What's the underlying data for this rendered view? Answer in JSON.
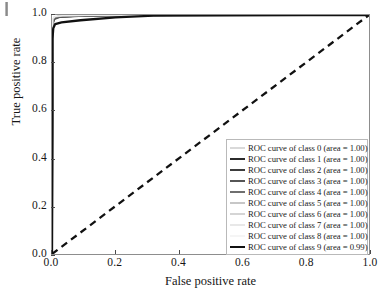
{
  "chart_data": {
    "type": "line",
    "title": "",
    "xlabel": "False positive rate",
    "ylabel": "True positive rate",
    "xlim": [
      0.0,
      1.0
    ],
    "ylim": [
      0.0,
      1.0
    ],
    "grid": false,
    "legend_position": "lower right",
    "xticks": [
      "0.0",
      "0.2",
      "0.4",
      "0.6",
      "0.8",
      "1.0"
    ],
    "yticks": [
      "0.0",
      "0.2",
      "0.4",
      "0.6",
      "0.8",
      "1.0"
    ],
    "xtick_values": [
      0.0,
      0.2,
      0.4,
      0.6,
      0.8,
      1.0
    ],
    "ytick_values": [
      0.0,
      0.2,
      0.4,
      0.6,
      0.8,
      1.0
    ],
    "reference_line": {
      "name": "chance level diagonal",
      "style": "dashed",
      "color": "#111111",
      "x": [
        0.0,
        1.0
      ],
      "y": [
        0.0,
        1.0
      ]
    },
    "series": [
      {
        "name": "ROC curve of class 0",
        "area": "1.00",
        "color": "#b4b4b4",
        "width": 1.4,
        "x": [
          0.0,
          0.002,
          0.006,
          0.02,
          0.06,
          0.15,
          0.35,
          0.6,
          1.0
        ],
        "y": [
          0.0,
          0.972,
          0.99,
          0.995,
          0.997,
          0.999,
          1.0,
          1.0,
          1.0
        ]
      },
      {
        "name": "ROC curve of class 1",
        "area": "1.00",
        "color": "#2b2b2b",
        "width": 2.0,
        "x": [
          0.0,
          0.002,
          0.006,
          0.02,
          0.07,
          0.17,
          0.38,
          0.65,
          1.0
        ],
        "y": [
          0.0,
          0.965,
          0.986,
          0.993,
          0.996,
          0.999,
          1.0,
          1.0,
          1.0
        ]
      },
      {
        "name": "ROC curve of class 2",
        "area": "1.00",
        "color": "#3d3d3d",
        "width": 1.8,
        "x": [
          0.0,
          0.002,
          0.007,
          0.022,
          0.08,
          0.19,
          0.4,
          0.68,
          1.0
        ],
        "y": [
          0.0,
          0.96,
          0.984,
          0.992,
          0.996,
          0.998,
          1.0,
          1.0,
          1.0
        ]
      },
      {
        "name": "ROC curve of class 3",
        "area": "1.00",
        "color": "#565656",
        "width": 1.6,
        "x": [
          0.0,
          0.002,
          0.007,
          0.024,
          0.085,
          0.2,
          0.42,
          0.7,
          1.0
        ],
        "y": [
          0.0,
          0.958,
          0.982,
          0.991,
          0.995,
          0.998,
          1.0,
          1.0,
          1.0
        ]
      },
      {
        "name": "ROC curve of class 4",
        "area": "1.00",
        "color": "#6f6f6f",
        "width": 1.5,
        "x": [
          0.0,
          0.002,
          0.008,
          0.026,
          0.09,
          0.21,
          0.44,
          0.72,
          1.0
        ],
        "y": [
          0.0,
          0.975,
          0.99,
          0.995,
          0.997,
          0.999,
          1.0,
          1.0,
          1.0
        ]
      },
      {
        "name": "ROC curve of class 5",
        "area": "1.00",
        "color": "#8f8f8f",
        "width": 1.4,
        "x": [
          0.0,
          0.002,
          0.008,
          0.028,
          0.095,
          0.22,
          0.46,
          0.74,
          1.0
        ],
        "y": [
          0.0,
          0.978,
          0.991,
          0.996,
          0.998,
          0.999,
          1.0,
          1.0,
          1.0
        ]
      },
      {
        "name": "ROC curve of class 6",
        "area": "1.00",
        "color": "#ababab",
        "width": 1.3,
        "x": [
          0.0,
          0.002,
          0.009,
          0.03,
          0.1,
          0.24,
          0.48,
          0.76,
          1.0
        ],
        "y": [
          0.0,
          0.98,
          0.992,
          0.996,
          0.998,
          0.999,
          1.0,
          1.0,
          1.0
        ]
      },
      {
        "name": "ROC curve of class 7",
        "area": "1.00",
        "color": "#d2d2d2",
        "width": 1.3,
        "x": [
          0.0,
          0.002,
          0.009,
          0.032,
          0.105,
          0.25,
          0.5,
          0.78,
          1.0
        ],
        "y": [
          0.0,
          0.983,
          0.993,
          0.997,
          0.998,
          1.0,
          1.0,
          1.0,
          1.0
        ]
      },
      {
        "name": "ROC curve of class 8",
        "area": "1.00",
        "color": "#ececec",
        "width": 1.3,
        "x": [
          0.0,
          0.002,
          0.01,
          0.034,
          0.11,
          0.26,
          0.52,
          0.8,
          1.0
        ],
        "y": [
          0.0,
          0.985,
          0.994,
          0.997,
          0.999,
          1.0,
          1.0,
          1.0,
          1.0
        ]
      },
      {
        "name": "ROC curve of class 9",
        "area": "0.99",
        "color": "#111111",
        "width": 2.3,
        "x": [
          0.0,
          0.0015,
          0.004,
          0.01,
          0.03,
          0.09,
          0.2,
          0.32,
          0.55,
          0.8,
          1.0
        ],
        "y": [
          0.0,
          0.9,
          0.945,
          0.962,
          0.969,
          0.978,
          0.99,
          0.997,
          0.999,
          1.0,
          1.0
        ]
      }
    ]
  },
  "legend": {
    "entries": [
      {
        "label": "ROC curve of class 0 (area = 1.00)"
      },
      {
        "label": "ROC curve of class 1 (area = 1.00)"
      },
      {
        "label": "ROC curve of class 2 (area = 1.00)"
      },
      {
        "label": "ROC curve of class 3 (area = 1.00)"
      },
      {
        "label": "ROC curve of class 4 (area = 1.00)"
      },
      {
        "label": "ROC curve of class 5 (area = 1.00)"
      },
      {
        "label": "ROC curve of class 6 (area = 1.00)"
      },
      {
        "label": "ROC curve of class 7 (area = 1.00)"
      },
      {
        "label": "ROC curve of class 8 (area = 1.00)"
      },
      {
        "label": "ROC curve of class 9 (area = 0.99)"
      }
    ]
  }
}
